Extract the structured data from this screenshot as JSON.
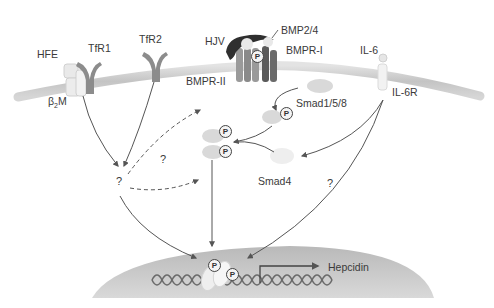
{
  "figure": {
    "type": "signaling-pathway-diagram",
    "topic": "Hepcidin transcription regulation"
  },
  "membrane_proteins": {
    "hfe": "HFE",
    "b2m_prefix": "β",
    "b2m_sub": "2",
    "b2m_suffix": "M",
    "tfr1": "TfR1",
    "tfr2": "TfR2",
    "hjv": "HJV",
    "bmp": "BMP2/4",
    "bmpr1": "BMPR-I",
    "bmpr2": "BMPR-II",
    "il6": "IL-6",
    "il6r": "IL-6R"
  },
  "cytoplasm": {
    "smad158": "Smad1/5/8",
    "smad4": "Smad4",
    "unknown_mediator": "?",
    "unknown_link": "?",
    "il6_unknown_link": "?"
  },
  "nucleus": {
    "gene": "Hepcidin"
  },
  "phospho_label": "P",
  "colors": {
    "membrane": "#c9c9c9",
    "receptor_dark": "#5e5e5e",
    "receptor_mid": "#8a8a8a",
    "hjv": "#2f2f2f",
    "ligand": "#e6e6e6",
    "smad": "#d6d6d6",
    "nucleus": "#cfcfcf",
    "dna": "#6a6a6a",
    "arrow": "#555555"
  }
}
